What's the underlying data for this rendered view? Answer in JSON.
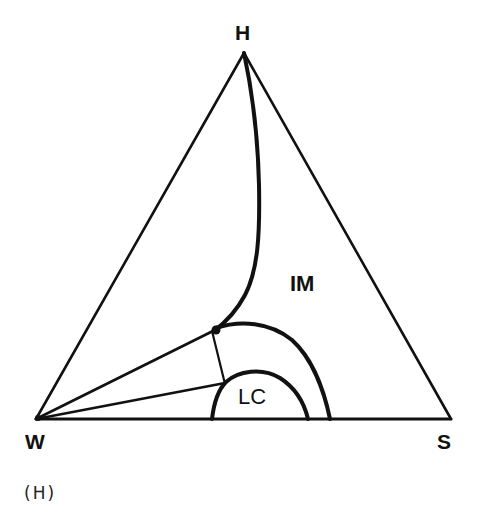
{
  "diagram": {
    "type": "ternary phase diagram",
    "vertices": {
      "top": "H",
      "bottom_left": "W",
      "bottom_right": "S"
    },
    "regions": {
      "isotropic_micellar": "IM",
      "liquid_crystal": "LC"
    },
    "caption": "(H)",
    "line_color": "#111111",
    "background_color": "#ffffff"
  }
}
